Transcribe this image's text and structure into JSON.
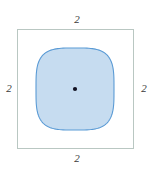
{
  "figure": {
    "outer_square": {
      "name": "outer-square",
      "stroke_color": "#b9c7c2",
      "fill_color": "#ffffff",
      "stroke_width": 1,
      "x": 17,
      "y": 29,
      "width": 116,
      "height": 119
    },
    "squircle": {
      "name": "inscribed-squircle",
      "fill_color": "#c6dcf0",
      "stroke_color": "#5b9bd5",
      "stroke_width": 1.1,
      "center_x": 75,
      "center_y": 89,
      "radius_x": 39,
      "radius_y": 41
    },
    "center_point": {
      "name": "center-point",
      "color": "#111122",
      "x": 75,
      "y": 89,
      "radius": 2.1
    },
    "labels": {
      "top": "2",
      "right": "2",
      "bottom": "2",
      "left": "2"
    }
  },
  "chart_data": {
    "type": "diagram",
    "shapes": [
      {
        "kind": "square",
        "label": "outer boundary square",
        "side_length": 2,
        "side_labels": {
          "top": "2",
          "right": "2",
          "bottom": "2",
          "left": "2"
        },
        "stroke": "#b9c7c2",
        "fill": "none"
      },
      {
        "kind": "squircle",
        "label": "inscribed superellipse region",
        "fill": "#c6dcf0",
        "stroke": "#5b9bd5"
      },
      {
        "kind": "point",
        "label": "center",
        "coordinates": [
          0,
          0
        ],
        "color": "#111122"
      }
    ],
    "annotations": [
      "2",
      "2",
      "2",
      "2"
    ],
    "legend": "none",
    "grid": false
  }
}
